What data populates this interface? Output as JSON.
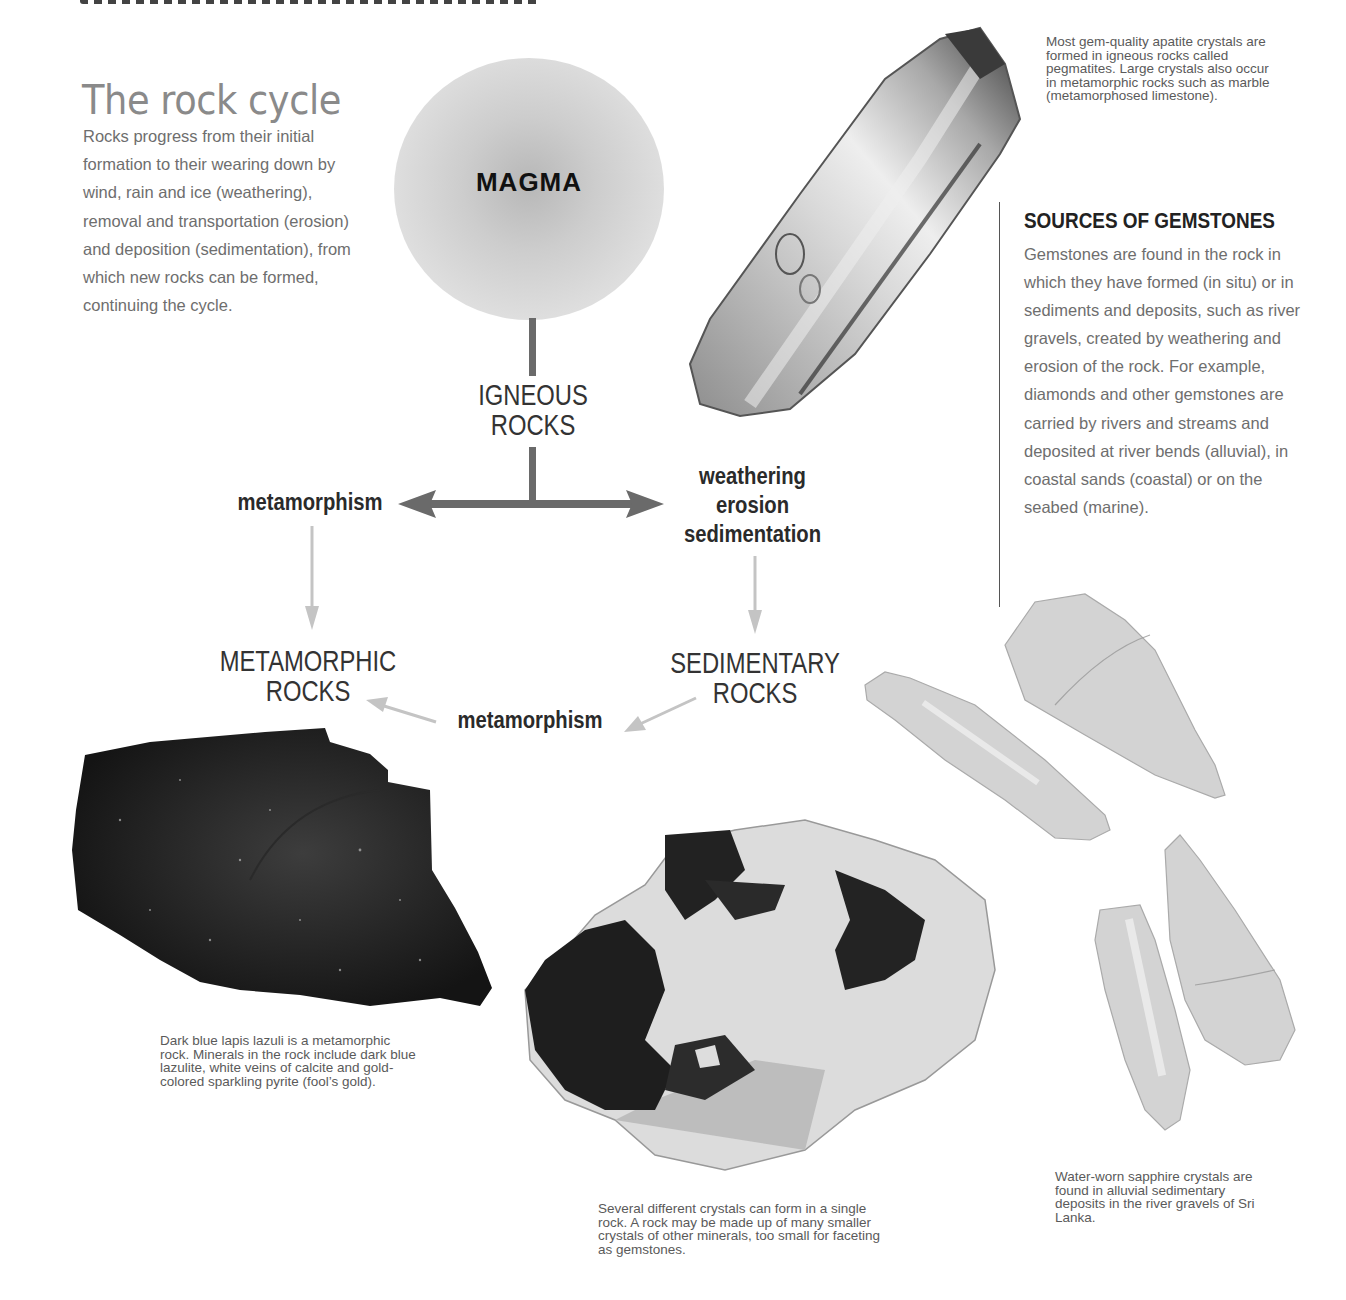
{
  "intro": {
    "title": "The rock cycle",
    "body": "Rocks progress from their initial formation to their wearing down by wind, rain and ice (weathering), removal and transportation (erosion) and deposition (sedimentation), from which new rocks can be formed, continuing the cycle."
  },
  "diagram": {
    "magma_label": "MAGMA",
    "igneous_line1": "IGNEOUS",
    "igneous_line2": "ROCKS",
    "metamorphic_line1": "METAMORPHIC",
    "metamorphic_line2": "ROCKS",
    "sedimentary_line1": "SEDIMENTARY",
    "sedimentary_line2": "ROCKS",
    "process_left": "metamorphism",
    "process_right_1": "weathering",
    "process_right_2": "erosion",
    "process_right_3": "sedimentation",
    "process_bottom": "metamorphism",
    "colors": {
      "main_arrow": "#6a6a6a",
      "secondary_arrow": "#c4c4c4",
      "magma_fill": "#d6d6d6"
    }
  },
  "sources": {
    "title": "SOURCES OF GEMSTONES",
    "body": "Gemstones are found in the rock in which they have formed (in situ) or in sediments and deposits, such as river gravels, created by weathering and erosion of the rock. For example, diamonds and other gemstones are carried by rivers and streams and deposited at river bends (alluvial), in coastal sands (coastal) or on the seabed (marine)."
  },
  "captions": {
    "apatite": "Most gem-quality apatite crystals are formed in igneous rocks called pegmatites. Large crystals also occur in metamorphic rocks such as marble (metamorphosed limestone).",
    "lapis": "Dark blue lapis lazuli is a metamorphic rock. Minerals in the rock include dark blue lazulite, white veins of calcite and gold-colored sparkling pyrite (fool’s gold).",
    "crystals": "Several different crystals can form in a single rock. A rock may be made up of many smaller crystals of other minerals, too small for faceting as gemstones.",
    "sapphire": "Water-worn sapphire crystals are found in alluvial sedimentary deposits in the river gravels of Sri Lanka."
  },
  "specimens": {
    "apatite": "apatite-crystal",
    "lapis": "lapis-lazuli-rock",
    "garnet_rock": "crystals-in-rock",
    "sapphires": "water-worn-sapphires"
  }
}
